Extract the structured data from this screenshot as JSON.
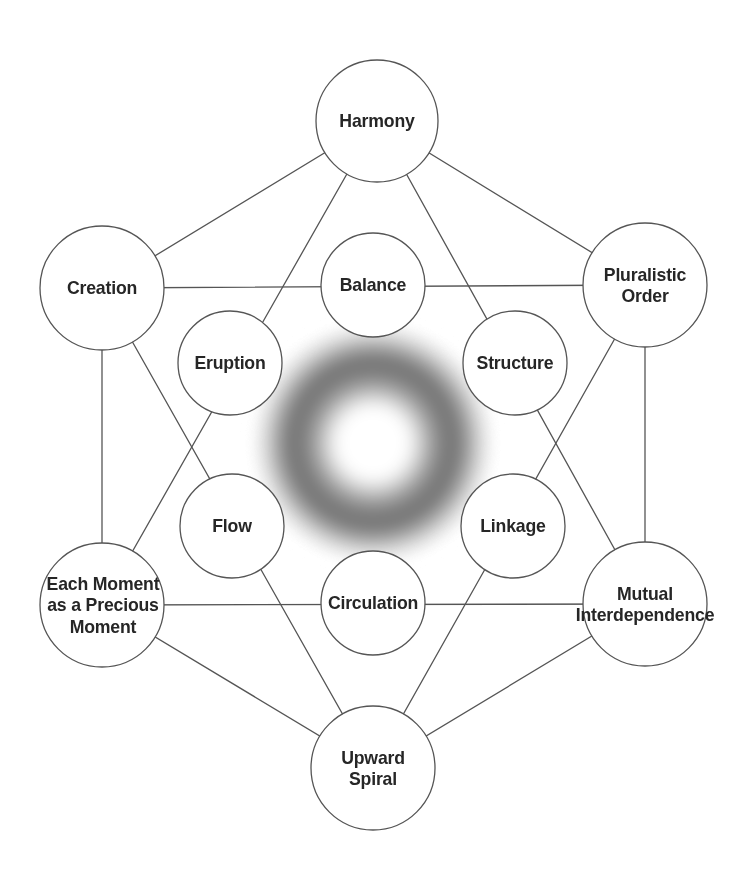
{
  "diagram": {
    "background_color": "#ffffff",
    "stroke_color": "#555555",
    "text_color": "#262626",
    "center_glow_color": "#6e6e6e",
    "outer_nodes": [
      {
        "id": "harmony",
        "label": "Harmony",
        "cx": 377,
        "cy": 121,
        "r": 61
      },
      {
        "id": "pluralistic",
        "label": "Pluralistic\nOrder",
        "cx": 645,
        "cy": 285,
        "r": 62
      },
      {
        "id": "mutual",
        "label": "Mutual\nInterdependence",
        "cx": 645,
        "cy": 604,
        "r": 62
      },
      {
        "id": "upward",
        "label": "Upward\nSpiral",
        "cx": 373,
        "cy": 768,
        "r": 62
      },
      {
        "id": "each",
        "label": "Each Moment\nas a Precious\nMoment",
        "cx": 102,
        "cy": 605,
        "r": 62
      },
      {
        "id": "creation",
        "label": "Creation",
        "cx": 102,
        "cy": 288,
        "r": 62
      }
    ],
    "inner_nodes": [
      {
        "id": "balance",
        "label": "Balance",
        "cx": 373,
        "cy": 285,
        "r": 52
      },
      {
        "id": "structure",
        "label": "Structure",
        "cx": 515,
        "cy": 363,
        "r": 52
      },
      {
        "id": "linkage",
        "label": "Linkage",
        "cx": 513,
        "cy": 526,
        "r": 52
      },
      {
        "id": "circulation",
        "label": "Circulation",
        "cx": 373,
        "cy": 603,
        "r": 52
      },
      {
        "id": "flow",
        "label": "Flow",
        "cx": 232,
        "cy": 526,
        "r": 52
      },
      {
        "id": "eruption",
        "label": "Eruption",
        "cx": 230,
        "cy": 363,
        "r": 52
      }
    ],
    "center_glow": {
      "cx": 373,
      "cy": 443,
      "outer_r": 118,
      "ring_peak_r": 82,
      "inner_white_r": 46
    },
    "hexagon_edges": [
      {
        "from": "creation",
        "to": "harmony"
      },
      {
        "from": "harmony",
        "to": "pluralistic"
      },
      {
        "from": "pluralistic",
        "to": "mutual"
      },
      {
        "from": "mutual",
        "to": "upward"
      },
      {
        "from": "upward",
        "to": "each"
      },
      {
        "from": "each",
        "to": "creation"
      }
    ],
    "triangle_up_edges": [
      {
        "from": "harmony",
        "to": "each"
      },
      {
        "from": "each",
        "to": "mutual"
      },
      {
        "from": "mutual",
        "to": "harmony"
      }
    ],
    "triangle_down_edges": [
      {
        "from": "creation",
        "to": "pluralistic"
      },
      {
        "from": "pluralistic",
        "to": "upward"
      },
      {
        "from": "upward",
        "to": "creation"
      }
    ]
  }
}
